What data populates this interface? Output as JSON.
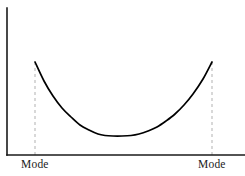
{
  "figure": {
    "background_color": "#ffffff",
    "width": 245,
    "height": 176
  },
  "axes": {
    "color": "#1a1a1a",
    "y_axis_name": "y-axis",
    "x_axis_name": "x-axis",
    "origin_x": 7,
    "origin_y": 155,
    "y_axis_top": 8,
    "x_axis_right": 245
  },
  "labels": {
    "left_mode": "Mode",
    "right_mode": "Mode"
  },
  "guides": {
    "color": "#b8b8b8",
    "left_x": 35,
    "right_x": 212,
    "top_left_y": 62,
    "top_right_y": 62,
    "bottom_y": 155
  },
  "chart_data": {
    "type": "line",
    "title": "",
    "subtitle": "",
    "xlabel": "",
    "ylabel": "",
    "grid": false,
    "legend": null,
    "curve_color": "#000000",
    "annotations": [
      "Mode",
      "Mode"
    ],
    "xlim": [
      7,
      245
    ],
    "ylim": [
      155,
      8
    ],
    "x": [
      35,
      44,
      53,
      62,
      71,
      80,
      89,
      98,
      105,
      113,
      122,
      131,
      139,
      148,
      157,
      166,
      175,
      184,
      193,
      203,
      212
    ],
    "y": [
      62,
      81,
      96,
      108,
      117,
      125,
      130,
      134,
      135.5,
      136,
      136,
      135.5,
      134,
      131,
      127,
      121,
      114,
      105,
      94,
      79,
      62
    ],
    "values": [
      62,
      81,
      96,
      108,
      117,
      125,
      130,
      134,
      135.5,
      136,
      136,
      135.5,
      134,
      131,
      127,
      121,
      114,
      105,
      94,
      79,
      62
    ],
    "modes": [
      {
        "label": "Mode",
        "x": 35,
        "y": 62
      },
      {
        "label": "Mode",
        "x": 212,
        "y": 62
      }
    ],
    "minimum": {
      "x": 122,
      "y": 136
    }
  }
}
